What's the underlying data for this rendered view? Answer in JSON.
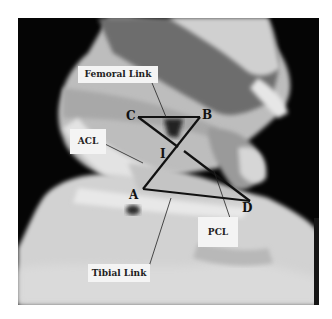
{
  "figure": {
    "labels": {
      "femoral_link": "Femoral Link",
      "acl": "ACL",
      "pcl": "PCL",
      "tibial_link": "Tibial Link"
    },
    "points": {
      "A": "A",
      "B": "B",
      "C": "C",
      "D": "D",
      "I": "I"
    },
    "colors": {
      "background": "#050505",
      "tissue_light": "#d8d8d8",
      "tissue_dark": "#6a6a6a",
      "lines": "#111111",
      "label_bg": "#f4f4f4"
    }
  }
}
